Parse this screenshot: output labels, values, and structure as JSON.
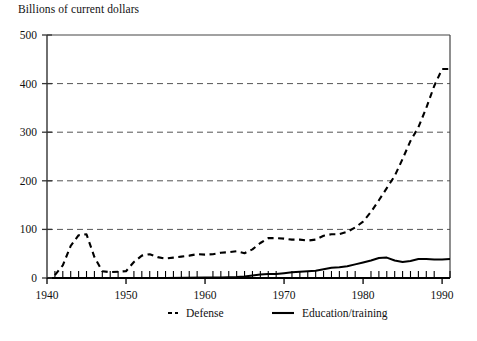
{
  "chart_data": {
    "type": "line",
    "title": "Billions of current dollars",
    "xlabel": "",
    "ylabel": "Billions of current dollars",
    "xlim": [
      1940,
      1991
    ],
    "ylim": [
      0,
      500
    ],
    "yticks": [
      0,
      100,
      200,
      300,
      400,
      500
    ],
    "xticks": [
      1940,
      1950,
      1960,
      1970,
      1980,
      1990
    ],
    "xtick_labels": [
      "1940",
      "1950",
      "1960",
      "1970",
      "1980",
      "1990"
    ],
    "ytick_labels": [
      "0",
      "100",
      "200",
      "300",
      "400",
      "500"
    ],
    "minor_xtick_interval": 1,
    "grid": "horizontal-dashed",
    "legend_position": "below-axes",
    "series": [
      {
        "name": "Defense",
        "style": "dashed",
        "color": "#000000",
        "x": [
          1941,
          1942,
          1943,
          1944,
          1945,
          1946,
          1947,
          1948,
          1949,
          1950,
          1951,
          1952,
          1953,
          1954,
          1955,
          1956,
          1957,
          1958,
          1959,
          1960,
          1961,
          1962,
          1963,
          1964,
          1965,
          1966,
          1967,
          1968,
          1969,
          1970,
          1971,
          1972,
          1973,
          1974,
          1975,
          1976,
          1977,
          1978,
          1979,
          1980,
          1981,
          1982,
          1983,
          1984,
          1985,
          1986,
          1987,
          1988,
          1989,
          1990,
          1991
        ],
        "values": [
          6,
          26,
          66,
          88,
          90,
          43,
          14,
          12,
          13,
          14,
          33,
          46,
          49,
          43,
          40,
          42,
          44,
          46,
          49,
          48,
          49,
          52,
          53,
          55,
          51,
          59,
          72,
          82,
          82,
          81,
          79,
          79,
          77,
          79,
          87,
          90,
          90,
          95,
          104,
          116,
          136,
          160,
          185,
          210,
          245,
          282,
          310,
          350,
          395,
          430,
          430
        ]
      },
      {
        "name": "Education/training",
        "style": "solid",
        "color": "#000000",
        "x": [
          1941,
          1945,
          1950,
          1955,
          1960,
          1962,
          1964,
          1965,
          1966,
          1967,
          1968,
          1969,
          1970,
          1971,
          1972,
          1973,
          1974,
          1975,
          1976,
          1977,
          1978,
          1979,
          1980,
          1981,
          1982,
          1983,
          1984,
          1985,
          1986,
          1987,
          1988,
          1989,
          1990,
          1991
        ],
        "values": [
          0,
          0,
          0,
          0,
          1,
          1,
          2,
          3,
          5,
          7,
          8,
          8,
          10,
          12,
          13,
          14,
          15,
          18,
          21,
          22,
          24,
          28,
          32,
          36,
          41,
          42,
          36,
          33,
          35,
          39,
          39,
          38,
          38,
          39
        ]
      }
    ],
    "legend": [
      {
        "label": "Defense",
        "style": "dashed"
      },
      {
        "label": "Education/training",
        "style": "solid"
      }
    ]
  },
  "layout": {
    "plot_left": 47,
    "plot_right": 450,
    "plot_top": 35,
    "plot_bottom": 278
  }
}
